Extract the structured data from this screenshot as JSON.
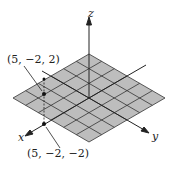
{
  "diagram": {
    "type": "3d-coordinate-system",
    "plane": {
      "grid_divisions": 6,
      "fill": "#bdbdbd",
      "line": "#333333"
    },
    "axes": {
      "x_label": "x",
      "y_label": "y",
      "z_label": "z"
    },
    "points": [
      {
        "label": "(5, −2, 2)",
        "coords": [
          5,
          -2,
          2
        ]
      },
      {
        "label": "(5, −2, −2)",
        "coords": [
          5,
          -2,
          -2
        ]
      }
    ]
  }
}
